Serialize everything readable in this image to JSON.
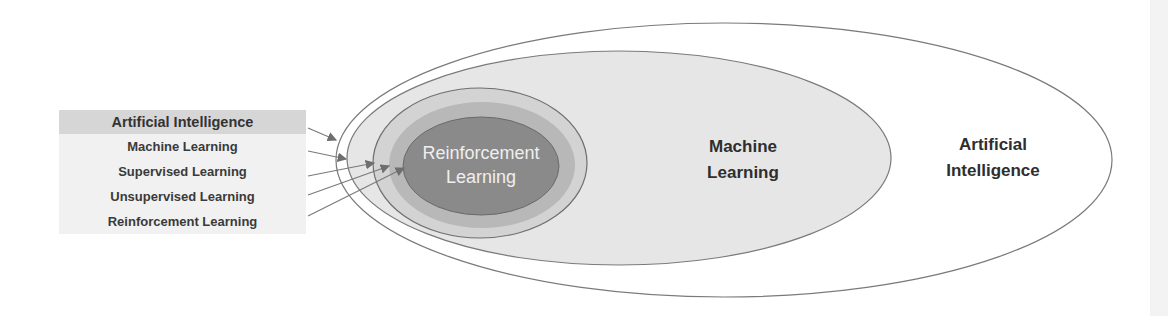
{
  "legend": {
    "items": [
      {
        "label": "Artificial Intelligence"
      },
      {
        "label": "Machine Learning"
      },
      {
        "label": "Supervised Learning"
      },
      {
        "label": "Unsupervised Learning"
      },
      {
        "label": "Reinforcement Learning"
      }
    ]
  },
  "diagram": {
    "labels": {
      "reinforcement_line1": "Reinforcement",
      "reinforcement_line2": "Learning",
      "ml_line1": "Machine",
      "ml_line2": "Learning",
      "ai_line1": "Artificial",
      "ai_line2": "Intelligence"
    },
    "colors": {
      "ai_fill": "#ffffff",
      "ml_fill": "#e6e6e6",
      "supervised_fill": "#cfcfcf",
      "unsupervised_fill": "#b3b3b3",
      "reinforcement_fill": "#8c8c8c",
      "stroke": "#7a7a7a"
    }
  }
}
